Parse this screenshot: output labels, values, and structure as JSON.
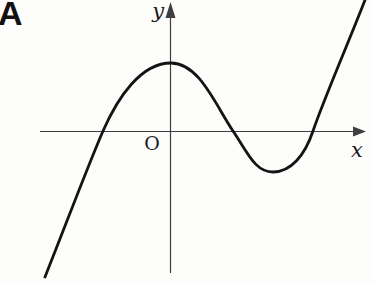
{
  "panel_label": "A",
  "chart_data": {
    "type": "line",
    "title": "",
    "origin_label": "O",
    "axis_color": "#3f3f3f",
    "axes": {
      "x": {
        "label": "x",
        "line": [
          40,
          131.5,
          355,
          131.5
        ],
        "arrow_points": "366,131.5 353,126.5 353,136.5"
      },
      "y": {
        "label": "y",
        "line": [
          170.5,
          16,
          170.5,
          273
        ],
        "arrow_points": "170.5,2 165.5,18 175.5,18"
      }
    },
    "curve": {
      "color": "#141414",
      "stroke_width": 2.8,
      "start": [
        45,
        277
      ],
      "segments": [
        {
          "c1": [
            63,
            232
          ],
          "c2": [
            87,
            168
          ],
          "to": [
            103,
            131
          ]
        },
        {
          "c1": [
            118,
            97
          ],
          "c2": [
            141,
            63
          ],
          "to": [
            171,
            63
          ]
        },
        {
          "c1": [
            199,
            63
          ],
          "c2": [
            215,
            104
          ],
          "to": [
            233,
            131
          ]
        },
        {
          "c1": [
            248,
            153
          ],
          "c2": [
            255,
            172
          ],
          "to": [
            273,
            172
          ]
        },
        {
          "c1": [
            291,
            172
          ],
          "c2": [
            305,
            155
          ],
          "to": [
            313,
            131
          ]
        },
        {
          "c1": [
            323,
            101
          ],
          "c2": [
            352,
            34
          ],
          "to": [
            365,
            0
          ]
        }
      ]
    },
    "key_points_px_from_origin": {
      "origin_px": [
        170,
        131
      ],
      "x_intercepts": [
        -67,
        63,
        143
      ],
      "local_max": [
        1,
        68
      ],
      "local_min": [
        103,
        -41
      ],
      "y_intercept": 68
    }
  }
}
